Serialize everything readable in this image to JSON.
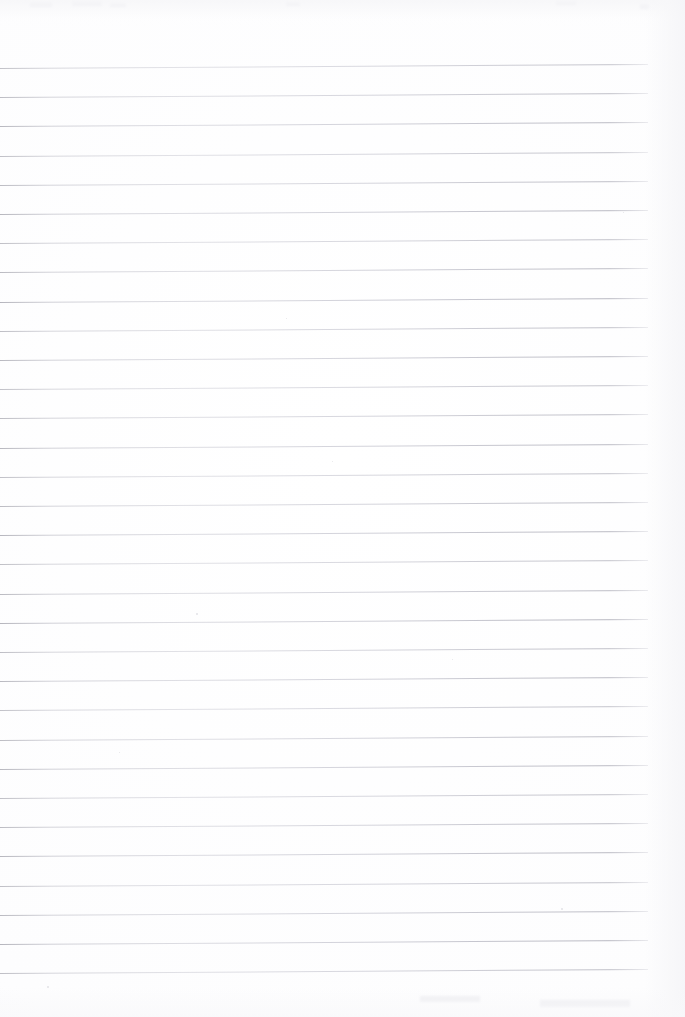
{
  "document": {
    "kind": "scanned-lined-notebook-page",
    "title": "Blank lined notebook page",
    "page_width": 685,
    "page_height": 1017,
    "content_text": "",
    "is_blank": true,
    "handwriting_present": "none",
    "background_color": "#fefefe",
    "paper_color": "#ffffff"
  },
  "ruling": {
    "style": "single-ruled horizontal lines",
    "line_color": "#c2c2ca",
    "line_thickness_px": 1,
    "line_count": 32,
    "first_line_y": 68,
    "line_spacing_px": 29.2,
    "line_start_x": 0,
    "line_end_x": 648,
    "skew_degrees": -0.36,
    "margin_line": "none",
    "header_blank_height_px": 68,
    "footer_blank_height_px": 45,
    "right_margin_px": 37,
    "lines_y": [
      68,
      97.2,
      126.4,
      155.6,
      184.8,
      214,
      243.2,
      272.4,
      301.6,
      330.8,
      360,
      389.2,
      418.4,
      447.6,
      476.8,
      506,
      535.2,
      564.4,
      593.6,
      622.8,
      652,
      681.2,
      710.4,
      739.6,
      768.8,
      798,
      827.2,
      856.4,
      885.6,
      914.8,
      944,
      973.2
    ]
  },
  "artifacts": {
    "description": "faint scanner dust specks and light smudges on otherwise blank paper",
    "specks": [
      {
        "x": 196,
        "y": 613,
        "size": 2
      },
      {
        "x": 561,
        "y": 908,
        "size": 2
      },
      {
        "x": 332,
        "y": 461,
        "size": 1
      },
      {
        "x": 47,
        "y": 986,
        "size": 2
      },
      {
        "x": 623,
        "y": 212,
        "size": 1
      },
      {
        "x": 286,
        "y": 318,
        "size": 1
      },
      {
        "x": 119,
        "y": 752,
        "size": 1
      },
      {
        "x": 452,
        "y": 659,
        "size": 1
      }
    ],
    "smudges": [
      {
        "x": 30,
        "y": 2,
        "w": 22,
        "h": 5
      },
      {
        "x": 72,
        "y": 1,
        "w": 30,
        "h": 5
      },
      {
        "x": 110,
        "y": 3,
        "w": 16,
        "h": 4
      },
      {
        "x": 286,
        "y": 2,
        "w": 14,
        "h": 4
      },
      {
        "x": 556,
        "y": 1,
        "w": 20,
        "h": 4
      },
      {
        "x": 640,
        "y": 4,
        "w": 9,
        "h": 5
      },
      {
        "x": 420,
        "y": 996,
        "w": 60,
        "h": 6
      },
      {
        "x": 540,
        "y": 1000,
        "w": 90,
        "h": 7
      }
    ]
  }
}
